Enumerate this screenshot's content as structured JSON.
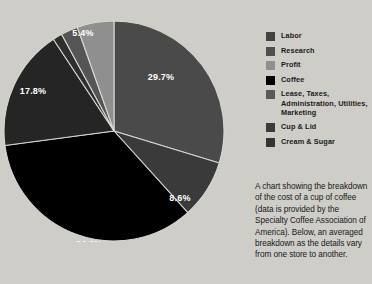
{
  "chart_data": {
    "type": "pie",
    "title": "",
    "legend_position": "top-right",
    "value_unit": "percent",
    "total_labeled": 96.1,
    "categories": [
      "Labor",
      "Research",
      "Coffee",
      "Lease, Taxes, Administration, Utilities, Marketing",
      "Cream & Sugar",
      "Cup & Lid",
      "Profit"
    ],
    "values": [
      29.7,
      8.6,
      34.6,
      17.8,
      1.4,
      2.5,
      5.4
    ],
    "slices": [
      {
        "label": "Labor",
        "value": 29.7,
        "display": "29.7%",
        "color": "#4a4a4a",
        "labeled": true,
        "label_x": 158,
        "label_y": 60
      },
      {
        "label": "Research",
        "value": 8.6,
        "display": "8.6%",
        "color": "#3a3a3a",
        "labeled": true,
        "label_x": 177,
        "label_y": 181
      },
      {
        "label": "Coffee",
        "value": 34.6,
        "display": "34.6%",
        "color": "#000000",
        "labeled": true,
        "label_x": 86,
        "label_y": 227
      },
      {
        "label": "Lease, Taxes, Administration, Utilities, Marketing",
        "value": 17.8,
        "display": "17.8%",
        "color": "#252525",
        "labeled": true,
        "label_x": 30,
        "label_y": 74
      },
      {
        "label": "Cream & Sugar",
        "value": 1.4,
        "display": "",
        "color": "#2e2e2e",
        "labeled": false,
        "label_x": 0,
        "label_y": 0
      },
      {
        "label": "Cup & Lid",
        "value": 2.5,
        "display": "",
        "color": "#555555",
        "labeled": false,
        "label_x": 0,
        "label_y": 0
      },
      {
        "label": "Profit",
        "value": 5.4,
        "display": "5.4%",
        "color": "#8f8f8f",
        "labeled": true,
        "label_x": 80,
        "label_y": 16
      }
    ]
  },
  "legend": {
    "items": [
      {
        "label": "Labor",
        "color": "#434343"
      },
      {
        "label": "Research",
        "color": "#4f4f4f"
      },
      {
        "label": "Profit",
        "color": "#8f8f8f"
      },
      {
        "label": "Coffee",
        "color": "#000000"
      },
      {
        "label": "Lease, Taxes, Administration, Utilities, Marketing",
        "color": "#5a5a5a"
      },
      {
        "label": "Cup & Lid",
        "color": "#3b3b3b"
      },
      {
        "label": "Cream & Sugar",
        "color": "#343434"
      }
    ]
  },
  "caption": {
    "text": "A chart showing the breakdown of the cost of a cup of coffee (data is provided by the Specialty Coffee Association of America). Below, an averaged breakdown as the details vary from one store to another."
  },
  "colors": {
    "background": "#cfcdc8",
    "label_text": "#ffffff",
    "body_text": "#16181a",
    "slice_divider": "#d8d6d1"
  }
}
